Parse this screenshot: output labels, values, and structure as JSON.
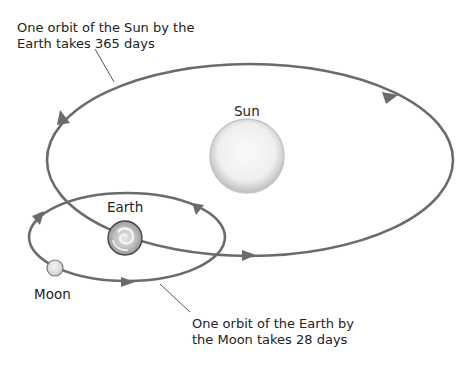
{
  "diagram": {
    "labels": {
      "sun": "Sun",
      "earth": "Earth",
      "moon": "Moon"
    },
    "annotations": {
      "earth_orbit": [
        "One orbit of the Sun by the",
        "Earth takes 365 days"
      ],
      "moon_orbit": [
        "One orbit of the Earth by",
        "the Moon takes 28 days"
      ]
    },
    "colors": {
      "orbit_line": "#6b6b6b",
      "leader_line": "#555555",
      "sun_fill": "#f2f2f2",
      "text": "#222222"
    }
  }
}
